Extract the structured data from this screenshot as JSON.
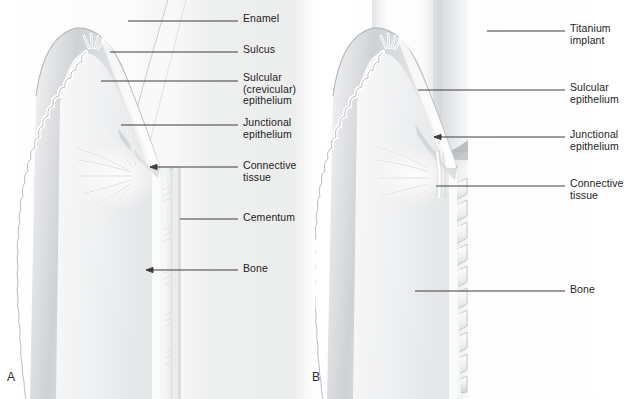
{
  "figure": {
    "background_color": "#ffffff",
    "text_color": "#232323",
    "leader_line_color": "#3c3c3c"
  },
  "panels": [
    {
      "id": "A",
      "letter": "A",
      "subject": "natural-tooth",
      "labels": [
        {
          "name": "enamel",
          "text": "Enamel",
          "x": 243,
          "y": 13,
          "leader": {
            "x1": 128,
            "y1": 21,
            "x2": 238,
            "y2": 21,
            "arrow": false
          }
        },
        {
          "name": "sulcus",
          "text": "Sulcus",
          "x": 243,
          "y": 44,
          "leader": {
            "x1": 110,
            "y1": 52,
            "x2": 238,
            "y2": 52,
            "arrow": false
          }
        },
        {
          "name": "sulcular-epithelium",
          "text": "Sulcular\n(crevicular)\nepithelium",
          "x": 243,
          "y": 72,
          "leader": {
            "x1": 101,
            "y1": 81,
            "x2": 238,
            "y2": 81,
            "arrow": false
          }
        },
        {
          "name": "junctional-epithelium",
          "text": "Junctional\nepithelium",
          "x": 243,
          "y": 117,
          "leader": {
            "x1": 121,
            "y1": 125,
            "x2": 238,
            "y2": 125,
            "arrow": false
          }
        },
        {
          "name": "connective-tissue",
          "text": "Connective\ntissue",
          "x": 243,
          "y": 160,
          "leader": {
            "x1": 150,
            "y1": 167,
            "x2": 238,
            "y2": 167,
            "arrow": true
          }
        },
        {
          "name": "cementum",
          "text": "Cementum",
          "x": 243,
          "y": 212,
          "leader": {
            "x1": 180,
            "y1": 219,
            "x2": 238,
            "y2": 219,
            "arrow": false
          }
        },
        {
          "name": "bone",
          "text": "Bone",
          "x": 243,
          "y": 263,
          "leader": {
            "x1": 146,
            "y1": 270,
            "x2": 238,
            "y2": 270,
            "arrow": true
          }
        }
      ]
    },
    {
      "id": "B",
      "letter": "B",
      "subject": "titanium-implant",
      "labels": [
        {
          "name": "titanium-implant",
          "text": "Titanium implant",
          "x": 570,
          "y": 23,
          "leader": {
            "x1": 487,
            "y1": 31,
            "x2": 565,
            "y2": 31,
            "arrow": false
          }
        },
        {
          "name": "sulcular-epithelium",
          "text": "Sulcular\nepithelium",
          "x": 570,
          "y": 82,
          "leader": {
            "x1": 418,
            "y1": 90,
            "x2": 565,
            "y2": 90,
            "arrow": false
          }
        },
        {
          "name": "junctional-epithelium",
          "text": "Junctional\nepithelium",
          "x": 570,
          "y": 129,
          "leader": {
            "x1": 434,
            "y1": 137,
            "x2": 565,
            "y2": 137,
            "arrow": true
          }
        },
        {
          "name": "connective-tissue",
          "text": "Connective\ntissue",
          "x": 570,
          "y": 178,
          "leader": {
            "x1": 436,
            "y1": 186,
            "x2": 565,
            "y2": 186,
            "arrow": false
          }
        },
        {
          "name": "bone",
          "text": "Bone",
          "x": 570,
          "y": 284,
          "leader": {
            "x1": 415,
            "y1": 291,
            "x2": 565,
            "y2": 291,
            "arrow": false
          }
        }
      ]
    }
  ],
  "anatomy": {
    "panel_a_structures": [
      "enamel",
      "sulcus",
      "sulcular-epithelium",
      "junctional-epithelium",
      "gingival-connective-tissue",
      "cementum",
      "alveolar-bone",
      "periodontal-ligament-fibers",
      "gingival-rete-pegs"
    ],
    "panel_b_structures": [
      "titanium-implant-body",
      "implant-screw-threads",
      "peri-implant-sulcus",
      "sulcular-epithelium",
      "junctional-epithelium",
      "peri-implant-connective-tissue",
      "alveolar-bone",
      "gingival-rete-pegs"
    ]
  },
  "palette": {
    "background": "#ffffff",
    "soft_tissue_light": "#f2f3f4",
    "soft_tissue_mid": "#d8dadc",
    "soft_tissue_dark": "#b4b8bc",
    "tooth_light": "#fbfbfc",
    "tooth_shade": "#e4e6e8",
    "implant_light": "#fdfdfd",
    "implant_shade": "#d4d6d9",
    "bone_marrow": "#9fa3a7",
    "outline": "#a9adb1"
  }
}
